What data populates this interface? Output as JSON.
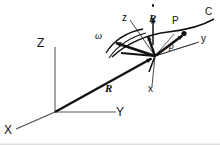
{
  "figure": {
    "background_color": "#ffffff",
    "line_color": "#111111",
    "thin_line_color": "#444444",
    "width": 220,
    "height": 145
  },
  "labels": {
    "fixed_x": "X",
    "fixed_y": "Y",
    "fixed_z": "Z",
    "moving_x": "x",
    "moving_y": "y",
    "moving_z": "z",
    "position_vector": "R",
    "velocity_vector": "R",
    "angular_velocity": "ω",
    "relative_vector": "ρ",
    "point": "P",
    "curve": "C"
  },
  "geometry": {
    "fixed_origin": [
      55,
      112
    ],
    "moving_origin": [
      155,
      56
    ],
    "point_p": [
      185,
      33
    ],
    "fixed_z_top": [
      55,
      45
    ],
    "fixed_y_end": [
      118,
      112
    ],
    "fixed_x_end": [
      14,
      130
    ]
  },
  "elements": [
    {
      "name": "fixed-z-axis",
      "kind": "axis",
      "label": "Z"
    },
    {
      "name": "fixed-y-axis",
      "kind": "axis",
      "label": "Y"
    },
    {
      "name": "fixed-x-axis",
      "kind": "axis",
      "label": "X"
    },
    {
      "name": "position-vector-R",
      "kind": "vector",
      "label": "R"
    },
    {
      "name": "velocity-vector-Rdot",
      "kind": "vector",
      "label": "Ṙ"
    },
    {
      "name": "angular-velocity-omega",
      "kind": "vector",
      "label": "ω"
    },
    {
      "name": "relative-vector-rho",
      "kind": "vector",
      "label": "ρ"
    },
    {
      "name": "moving-x-axis",
      "kind": "axis",
      "label": "x"
    },
    {
      "name": "moving-y-axis",
      "kind": "axis",
      "label": "y"
    },
    {
      "name": "moving-z-axis",
      "kind": "axis",
      "label": "z"
    },
    {
      "name": "curve-C",
      "kind": "curve",
      "label": "C"
    },
    {
      "name": "point-P",
      "kind": "point",
      "label": "P"
    }
  ]
}
